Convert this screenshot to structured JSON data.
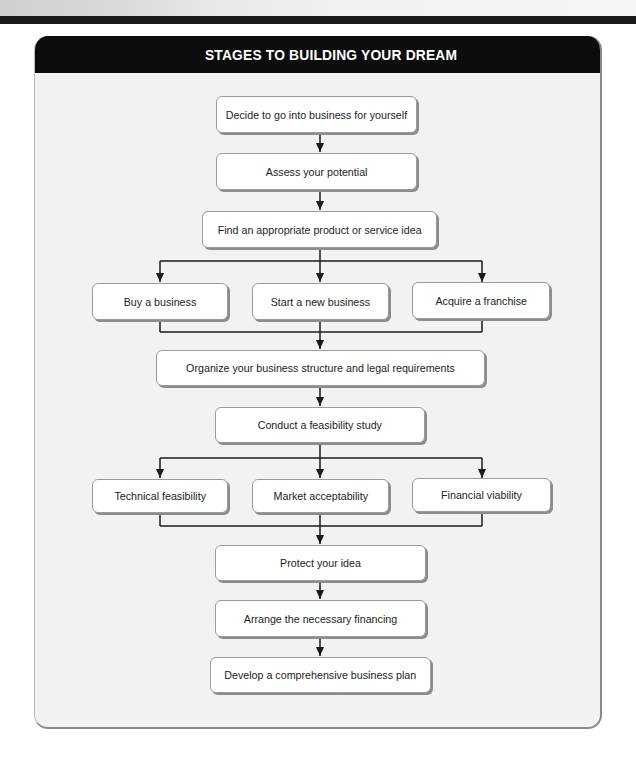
{
  "title": "STAGES TO BUILDING YOUR DREAM",
  "colors": {
    "header_bg": "#0d0d0d",
    "header_text": "#ffffff",
    "panel_bg": "#f2f2f0",
    "box_bg": "#ffffff",
    "line": "#1a1a1a"
  },
  "flowchart": {
    "steps": [
      {
        "id": "decide",
        "label": "Decide to go into business for yourself"
      },
      {
        "id": "assess",
        "label": "Assess your potential"
      },
      {
        "id": "find",
        "label": "Find an appropriate product or service idea"
      },
      {
        "id": "organize",
        "label": "Organize your business structure and legal requirements"
      },
      {
        "id": "conduct",
        "label": "Conduct a feasibility study"
      },
      {
        "id": "protect",
        "label": "Protect your idea"
      },
      {
        "id": "arrange",
        "label": "Arrange the necessary financing"
      },
      {
        "id": "develop",
        "label": "Develop a comprehensive business plan"
      }
    ],
    "branch_1": [
      {
        "id": "buy",
        "label": "Buy a business"
      },
      {
        "id": "start",
        "label": "Start a new business"
      },
      {
        "id": "acquire",
        "label": "Acquire a franchise"
      }
    ],
    "branch_2": [
      {
        "id": "technical",
        "label": "Technical feasibility"
      },
      {
        "id": "market",
        "label": "Market acceptability"
      },
      {
        "id": "financial",
        "label": "Financial viability"
      }
    ],
    "edges": [
      [
        "decide",
        "assess"
      ],
      [
        "assess",
        "find"
      ],
      [
        "find",
        "buy"
      ],
      [
        "find",
        "start"
      ],
      [
        "find",
        "acquire"
      ],
      [
        "buy",
        "organize"
      ],
      [
        "start",
        "organize"
      ],
      [
        "acquire",
        "organize"
      ],
      [
        "organize",
        "conduct"
      ],
      [
        "conduct",
        "technical"
      ],
      [
        "conduct",
        "market"
      ],
      [
        "conduct",
        "financial"
      ],
      [
        "technical",
        "protect"
      ],
      [
        "market",
        "protect"
      ],
      [
        "financial",
        "protect"
      ],
      [
        "protect",
        "arrange"
      ],
      [
        "arrange",
        "develop"
      ]
    ]
  }
}
